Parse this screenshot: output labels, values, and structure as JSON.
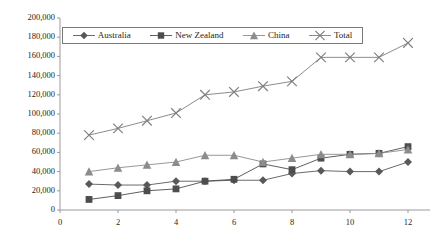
{
  "chart_data": {
    "type": "line",
    "title": "",
    "xlabel": "",
    "ylabel": "",
    "xlim": [
      0,
      12
    ],
    "ylim": [
      0,
      200000
    ],
    "grid": false,
    "legend_position": "top",
    "x": [
      1,
      2,
      3,
      4,
      5,
      6,
      7,
      8,
      9,
      10,
      11,
      12
    ],
    "xticks": [
      0,
      2,
      4,
      6,
      8,
      10,
      12
    ],
    "xtick_labels": [
      "0",
      "2",
      "4",
      "6",
      "8",
      "10",
      "12"
    ],
    "yticks": [
      0,
      20000,
      40000,
      60000,
      80000,
      100000,
      120000,
      140000,
      160000,
      180000,
      200000
    ],
    "ytick_labels": [
      "0",
      "20,000",
      "40,000",
      "60,000",
      "80,000",
      "100,000",
      "120,000",
      "140,000",
      "160,000",
      "180,000",
      "200,000"
    ],
    "series": [
      {
        "name": "Australia",
        "marker": "diamond",
        "color": "#595959",
        "values": [
          27000,
          26000,
          26000,
          30000,
          30000,
          31000,
          31000,
          38000,
          41000,
          40000,
          40000,
          50000
        ]
      },
      {
        "name": "New Zealand",
        "marker": "square",
        "color": "#4d4d4d",
        "values": [
          11000,
          15000,
          20000,
          22000,
          30000,
          32000,
          48000,
          42000,
          54000,
          58000,
          59000,
          66000
        ]
      },
      {
        "name": "China",
        "marker": "triangle",
        "color": "#8c8c8c",
        "values": [
          40000,
          44000,
          47000,
          50000,
          57000,
          57000,
          50000,
          54000,
          58000,
          58000,
          59000,
          63000
        ]
      },
      {
        "name": "Total",
        "marker": "cross",
        "color": "#7f7f7f",
        "values": [
          78000,
          85000,
          93000,
          101000,
          120000,
          123000,
          129000,
          134000,
          159000,
          159000,
          159000,
          174000
        ]
      }
    ]
  },
  "axis": {
    "y_axis_name": "value-axis",
    "x_axis_name": "category-axis"
  }
}
